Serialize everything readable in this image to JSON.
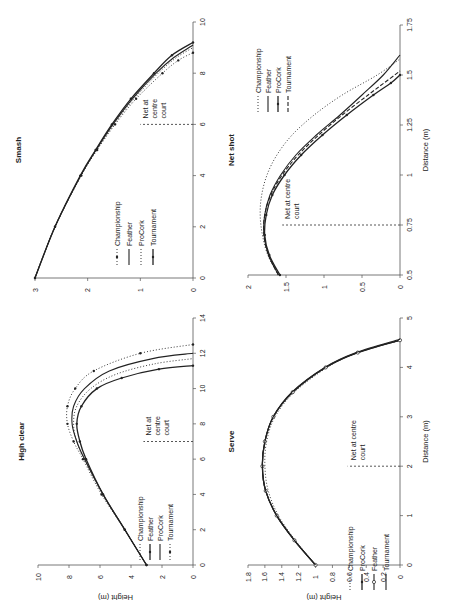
{
  "figure": {
    "orientation": "rotated 90 degrees counter-clockwise",
    "net_label": "Net at centre court",
    "xlabel": "Distance (m)",
    "ylabel": "Height (m)"
  },
  "chart_data": [
    {
      "id": "smash",
      "type": "line",
      "title": "Smash",
      "xlabel": "",
      "ylabel": "",
      "xlim": [
        0,
        10
      ],
      "ylim": [
        0,
        3
      ],
      "xticks": [
        "0",
        "2",
        "4",
        "6",
        "8",
        "10"
      ],
      "yticks": [
        "0",
        "1",
        "2",
        "3"
      ],
      "net_x": 6,
      "legend": [
        "Championship",
        "Feather",
        "ProCork",
        "Tournament"
      ],
      "series": [
        {
          "name": "Championship",
          "style": "dotted-marker",
          "x": [
            0,
            2,
            4,
            5,
            6,
            7,
            8,
            8.5,
            8.8
          ],
          "y": [
            3.0,
            2.62,
            2.12,
            1.82,
            1.48,
            1.08,
            0.58,
            0.28,
            0.0
          ]
        },
        {
          "name": "Feather",
          "style": "solid",
          "x": [
            0,
            2,
            4,
            5,
            6,
            7,
            8,
            8.6,
            9.1
          ],
          "y": [
            3.0,
            2.62,
            2.13,
            1.84,
            1.52,
            1.15,
            0.7,
            0.37,
            0.0
          ]
        },
        {
          "name": "ProCork",
          "style": "dotted",
          "x": [
            0,
            2,
            4,
            5,
            6,
            7,
            8,
            8.6,
            9.0
          ],
          "y": [
            3.0,
            2.62,
            2.13,
            1.83,
            1.5,
            1.12,
            0.66,
            0.32,
            0.0
          ]
        },
        {
          "name": "Tournament",
          "style": "solid-marker",
          "x": [
            0,
            2,
            4,
            5,
            6,
            7,
            8,
            8.7,
            9.2
          ],
          "y": [
            3.0,
            2.62,
            2.14,
            1.85,
            1.54,
            1.18,
            0.74,
            0.4,
            0.0
          ]
        }
      ]
    },
    {
      "id": "high_clear",
      "type": "line",
      "title": "High clear",
      "xlabel": "",
      "ylabel": "Height (m)",
      "xlim": [
        0,
        14
      ],
      "ylim": [
        0,
        10
      ],
      "xticks": [
        "0",
        "2",
        "4",
        "6",
        "8",
        "10",
        "12",
        "14"
      ],
      "yticks": [
        "0",
        "2",
        "4",
        "6",
        "8",
        "10"
      ],
      "net_x": 7,
      "legend": [
        "Championship",
        "Feather",
        "ProCork",
        "Tournament"
      ],
      "series": [
        {
          "name": "Championship",
          "style": "dotted",
          "x": [
            0,
            2,
            4,
            6,
            7,
            8,
            9,
            10,
            10.8,
            11.4,
            11.7
          ],
          "y": [
            3.0,
            4.4,
            5.8,
            7.0,
            7.5,
            7.7,
            7.5,
            6.6,
            5.0,
            2.5,
            0.0
          ]
        },
        {
          "name": "Feather",
          "style": "solid-marker",
          "x": [
            0,
            2,
            4,
            6,
            7,
            8,
            9,
            10,
            10.6,
            11.1,
            11.3
          ],
          "y": [
            3.0,
            4.4,
            5.8,
            6.9,
            7.3,
            7.5,
            7.2,
            6.2,
            4.6,
            2.2,
            0.0
          ]
        },
        {
          "name": "ProCork",
          "style": "solid",
          "x": [
            0,
            2,
            4,
            6,
            7,
            8,
            9,
            10,
            11,
            11.7,
            12.0
          ],
          "y": [
            3.0,
            4.4,
            5.8,
            7.0,
            7.5,
            7.8,
            7.7,
            7.0,
            5.4,
            2.6,
            0.0
          ]
        },
        {
          "name": "Tournament",
          "style": "dotted-marker",
          "x": [
            0,
            2,
            4,
            6,
            7,
            8,
            9,
            10,
            11,
            12,
            12.5
          ],
          "y": [
            3.0,
            4.4,
            5.9,
            7.1,
            7.7,
            8.1,
            8.1,
            7.6,
            6.4,
            3.4,
            0.0
          ]
        }
      ]
    },
    {
      "id": "net_shot",
      "type": "line",
      "title": "Net shot",
      "xlabel": "Distance (m)",
      "ylabel": "",
      "xlim": [
        0.5,
        1.75
      ],
      "ylim": [
        0,
        2
      ],
      "xticks": [
        "0.5",
        "0.75",
        "1",
        "1.25",
        "1.5",
        "1.75"
      ],
      "yticks": [
        "0",
        "0.5",
        "1",
        "1.5",
        "2"
      ],
      "net_x": 0.75,
      "legend": [
        "Championship",
        "Feather",
        "ProCork",
        "Tournament"
      ],
      "series": [
        {
          "name": "Championship",
          "style": "dotted",
          "x": [
            0.5,
            0.6,
            0.7,
            0.8,
            0.9,
            1.0,
            1.1,
            1.2,
            1.3,
            1.4,
            1.5,
            1.58
          ],
          "y": [
            1.6,
            1.74,
            1.81,
            1.84,
            1.82,
            1.75,
            1.62,
            1.42,
            1.13,
            0.76,
            0.3,
            0.0
          ]
        },
        {
          "name": "Feather",
          "style": "solid",
          "x": [
            0.5,
            0.6,
            0.7,
            0.8,
            0.9,
            1.0,
            1.1,
            1.2,
            1.3,
            1.4,
            1.5,
            1.6
          ],
          "y": [
            1.6,
            1.73,
            1.79,
            1.78,
            1.71,
            1.57,
            1.37,
            1.1,
            0.79,
            0.5,
            0.22,
            0.0
          ]
        },
        {
          "name": "ProCork",
          "style": "solid-marker",
          "x": [
            0.5,
            0.6,
            0.7,
            0.8,
            0.9,
            1.0,
            1.1,
            1.2,
            1.3,
            1.4,
            1.46,
            1.5
          ],
          "y": [
            1.58,
            1.72,
            1.78,
            1.76,
            1.68,
            1.52,
            1.3,
            1.02,
            0.7,
            0.35,
            0.12,
            0.0
          ]
        },
        {
          "name": "Tournament",
          "style": "dashed",
          "x": [
            0.5,
            0.6,
            0.7,
            0.8,
            0.9,
            1.0,
            1.1,
            1.2,
            1.3,
            1.4,
            1.48,
            1.52
          ],
          "y": [
            1.6,
            1.73,
            1.79,
            1.78,
            1.7,
            1.55,
            1.34,
            1.07,
            0.76,
            0.42,
            0.14,
            0.0
          ]
        }
      ]
    },
    {
      "id": "serve",
      "type": "line",
      "title": "Serve",
      "xlabel": "Distance (m)",
      "ylabel": "Height (m)",
      "xlim": [
        0,
        5
      ],
      "ylim": [
        0,
        1.8
      ],
      "xticks": [
        "0",
        "1",
        "2",
        "3",
        "4",
        "5"
      ],
      "yticks": [
        "0",
        "0.2",
        "0.4",
        "0.6",
        "0.8",
        "1",
        "1.2",
        "1.4",
        "1.6",
        "1.8"
      ],
      "net_x": 2,
      "legend": [
        "Championship",
        "ProCork",
        "Feather",
        "Tournament"
      ],
      "series": [
        {
          "name": "Championship",
          "style": "dotted",
          "x": [
            0,
            0.5,
            1,
            1.5,
            2,
            2.5,
            3,
            3.5,
            4,
            4.3,
            4.55
          ],
          "y": [
            1.0,
            1.24,
            1.44,
            1.56,
            1.6,
            1.58,
            1.48,
            1.25,
            0.86,
            0.5,
            0.0
          ]
        },
        {
          "name": "ProCork",
          "style": "solid-marker",
          "x": [
            0,
            0.5,
            1,
            1.5,
            2,
            2.5,
            3,
            3.5,
            4,
            4.3,
            4.55
          ],
          "y": [
            1.0,
            1.25,
            1.46,
            1.59,
            1.63,
            1.6,
            1.5,
            1.27,
            0.88,
            0.5,
            0.0
          ]
        },
        {
          "name": "Feather",
          "style": "solid-circle",
          "x": [
            0,
            0.5,
            1,
            1.5,
            2,
            2.5,
            3,
            3.5,
            4,
            4.3,
            4.55
          ],
          "y": [
            1.0,
            1.25,
            1.46,
            1.59,
            1.63,
            1.6,
            1.5,
            1.27,
            0.88,
            0.5,
            0.0
          ]
        },
        {
          "name": "Tournament",
          "style": "solid",
          "x": [
            0,
            0.5,
            1,
            1.5,
            2,
            2.5,
            3,
            3.5,
            4,
            4.3,
            4.57
          ],
          "y": [
            1.0,
            1.25,
            1.46,
            1.59,
            1.63,
            1.6,
            1.5,
            1.28,
            0.89,
            0.52,
            0.0
          ]
        }
      ]
    }
  ],
  "panels_layout": {
    "smash": {
      "left": 35,
      "right": 193,
      "top": 22,
      "bottom": 278
    },
    "high_clear": {
      "left": 38,
      "right": 193,
      "top": 318,
      "bottom": 565
    },
    "net_shot": {
      "left": 248,
      "right": 400,
      "top": 25,
      "bottom": 275
    },
    "serve": {
      "left": 248,
      "right": 400,
      "top": 318,
      "bottom": 565
    }
  },
  "colors": {
    "ink": "#222222",
    "axis": "#555555",
    "background": "#ffffff"
  }
}
